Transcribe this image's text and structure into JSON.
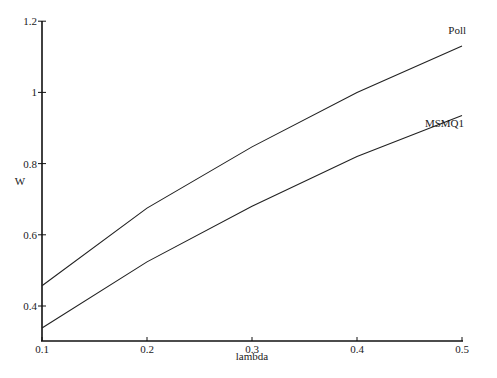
{
  "chart_data": {
    "type": "line",
    "title": "",
    "xlabel": "lambda",
    "ylabel": "W",
    "xlim": [
      0.1,
      0.5
    ],
    "ylim": [
      0.32,
      1.2
    ],
    "x": [
      0.1,
      0.2,
      0.3,
      0.4,
      0.5
    ],
    "xticks": [
      "0.1",
      "0.2",
      "0.3",
      "0.4",
      "0.5"
    ],
    "yticks": [
      "0.4",
      "0.6",
      "0.8",
      "1",
      "1.2"
    ],
    "grid": false,
    "legend": "inline labels at right end of lines",
    "series": [
      {
        "name": "Poll",
        "values": [
          0.457,
          0.675,
          0.847,
          1.0,
          1.13
        ]
      },
      {
        "name": "MSMQ1",
        "values": [
          0.338,
          0.524,
          0.68,
          0.82,
          0.935
        ]
      }
    ]
  }
}
